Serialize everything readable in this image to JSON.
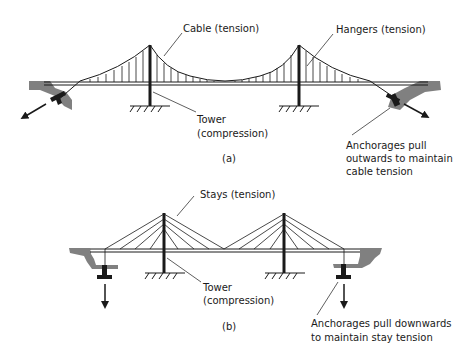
{
  "diagram_a": {
    "caption": "(a)",
    "labels": {
      "cable": "Cable (tension)",
      "hangers": "Hangers (tension)",
      "tower_line1": "Tower",
      "tower_line2": "(compression)",
      "anchor_line1": "Anchorages pull",
      "anchor_line2": "outwards to maintain",
      "anchor_line3": "cable tension"
    }
  },
  "diagram_b": {
    "caption": "(b)",
    "labels": {
      "stays": "Stays (tension)",
      "tower_line1": "Tower",
      "tower_line2": "(compression)",
      "anchor_line1": "Anchorages pull downwards",
      "anchor_line2": "to maintain stay tension"
    }
  },
  "colors": {
    "line": "#1a1a1a",
    "ground": "#808080"
  }
}
